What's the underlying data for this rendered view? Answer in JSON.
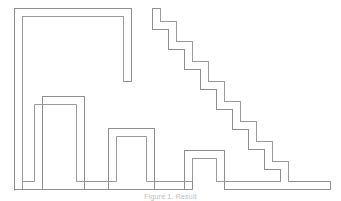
{
  "figure": {
    "caption": "Figure 1. Result",
    "canvas": {
      "width": 341,
      "height": 201,
      "background_color": "#ffffff"
    },
    "stroke": {
      "color": "#8d8d8d",
      "inner_color": "#9a9a9a",
      "width": 1
    },
    "geometry": {
      "corridor_width": 8,
      "outer_path": "M 12,190 L 12,10 L 130,10 L 130,80 L 122,80 L 122,18 L 20,18 L 20,182 L 44,182 L 44,98 L 82,98 L 82,182 L 110,182 L 110,130 L 152,130 L 152,182 L 186,182 L 186,152 L 222,152 L 222,182 L 290,182 L 290,170 L 266,170 L 266,150 L 250,150 L 250,130 L 234,130 L 234,110 L 218,110 L 218,90 L 202,90 L 202,70 L 186,70 L 186,50 L 170,50 L 170,30 L 154,30 L 154,10 L 162,10 L 162,22 L 178,22 L 178,42 L 194,42 L 194,62 L 210,62 L 210,82 L 226,82 L 226,102 L 242,102 L 242,122 L 258,122 L 258,142 L 274,142 L 274,162 L 298,162 L 298,190 Z",
      "vertices_left_spiral": [
        [
          12,
          190
        ],
        [
          12,
          10
        ],
        [
          130,
          10
        ],
        [
          130,
          80
        ],
        [
          122,
          80
        ],
        [
          122,
          18
        ],
        [
          20,
          18
        ],
        [
          20,
          182
        ],
        [
          44,
          182
        ],
        [
          44,
          98
        ],
        [
          82,
          98
        ],
        [
          82,
          182
        ],
        [
          110,
          182
        ],
        [
          110,
          130
        ],
        [
          152,
          130
        ],
        [
          152,
          182
        ]
      ],
      "vertices_right_staircase": [
        [
          154,
          10
        ],
        [
          154,
          30
        ],
        [
          170,
          30
        ],
        [
          170,
          50
        ],
        [
          186,
          50
        ],
        [
          186,
          70
        ],
        [
          202,
          70
        ],
        [
          202,
          90
        ],
        [
          218,
          90
        ],
        [
          218,
          110
        ],
        [
          234,
          110
        ],
        [
          234,
          130
        ],
        [
          250,
          130
        ],
        [
          250,
          150
        ],
        [
          266,
          150
        ],
        [
          266,
          170
        ],
        [
          290,
          170
        ],
        [
          290,
          182
        ]
      ],
      "staircase_step_count": 8,
      "staircase_step_width": 16,
      "staircase_step_height": 20,
      "baseline_y": 190,
      "right_terminus_x": 330
    }
  }
}
